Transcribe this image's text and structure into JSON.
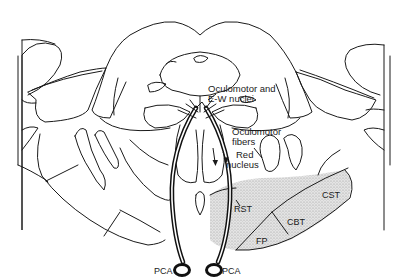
{
  "diagram": {
    "labels": {
      "oculomotor_nuclei_line1": "Oculomotor and",
      "oculomotor_nuclei_line2": "E-W nuclei",
      "oculomotor_fibers_line1": "Oculomotor",
      "oculomotor_fibers_line2": "fibers",
      "red_nucleus_line1": "Red",
      "red_nucleus_line2": "nucleus",
      "rst": "RST",
      "cst": "CST",
      "cbt": "CBT",
      "fp": "FP",
      "pca_left": "PCA",
      "pca_right": "PCA"
    },
    "colors": {
      "line": "#1a1a1a",
      "stipple": "#c8c8c8",
      "background": "#ffffff"
    }
  }
}
